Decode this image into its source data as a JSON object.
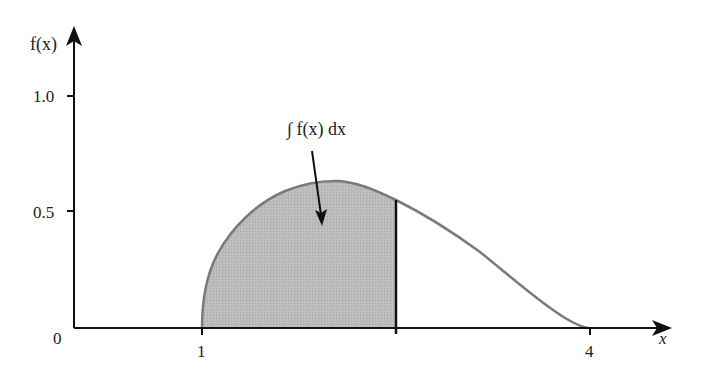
{
  "figure": {
    "y_axis": {
      "label": "f(x)",
      "ticks": [
        {
          "label": "1.0",
          "value": 1.0
        },
        {
          "label": "0.5",
          "value": 0.5
        }
      ],
      "origin_label": "0"
    },
    "x_axis": {
      "label": "x",
      "ticks": [
        {
          "label": "1",
          "value": 1
        },
        {
          "label": "4",
          "value": 4
        }
      ]
    },
    "annotation": {
      "text": "∫ f(x) dx",
      "points_to": "shaded-area"
    },
    "colors": {
      "axis": "#111111",
      "curve": "#7a7a7a",
      "shade": "#b8b8b8",
      "boundary": "#111111"
    }
  }
}
